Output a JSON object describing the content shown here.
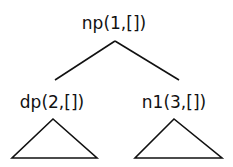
{
  "diagram": {
    "type": "syntax-tree",
    "root": {
      "label": "np(1,[])",
      "children": [
        {
          "label": "dp(2,[])",
          "subtree": "collapsed-triangle"
        },
        {
          "label": "n1(3,[])",
          "subtree": "collapsed-triangle"
        }
      ]
    }
  },
  "colors": {
    "ink": "#111111",
    "background": "#ffffff"
  }
}
